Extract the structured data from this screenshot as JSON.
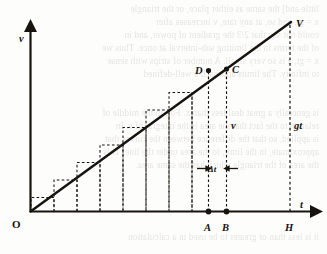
{
  "figure": {
    "kind": "velocity-time-graph",
    "axes": {
      "y_label": "v",
      "x_label": "t",
      "origin_label": "O"
    },
    "point_labels": {
      "apex": "V",
      "d": "D",
      "c": "C",
      "a": "A",
      "b": "B",
      "h": "H"
    },
    "annotations": {
      "height_label": "gt",
      "strip_height_label": "v",
      "strip_width_label": "Δt"
    },
    "colors": {
      "ink": "#17140f",
      "paper": "#fdfdfb",
      "bleed": "#6b6458"
    },
    "bleed_text": [
      "little and] the same as either place, or the triangle",
      "x = gt, and so, at any rate, v increases after",
      "could not say that 2/3 the gradient of power, and in",
      "of the terms in the limiting sub-interval at once. Thus we",
      "x = gt, a is so very small. A number of strips with sense",
      "to infinity. The limits approach a well-defined",
      "is generally a great deal less than x. For, in the middle of",
      "relation to the fact that the area is the integral of v. In",
      "is applied, so that the difference between the curves that",
      "approximate, in the limit, to the area under the line. This",
      "the area of the triangle which has the same area.",
      "it is less than or greater to be used in a calculation"
    ]
  },
  "chart_data": {
    "type": "line",
    "title": "",
    "xlabel": "t",
    "ylabel": "v",
    "xlim": [
      0,
      1
    ],
    "ylim": [
      0,
      1
    ],
    "grid": false,
    "legend": "none",
    "series": [
      {
        "name": "v = gt",
        "x": [
          0,
          1
        ],
        "y": [
          0,
          1
        ],
        "style": "solid-thick"
      }
    ],
    "step_approximation": {
      "description": "Dashed rectangular strips (lower Riemann sum) beneath the line v = gt",
      "n_strips": 11,
      "strip_width_label": "Δt",
      "x_edges": [
        0.0,
        0.0909,
        0.1818,
        0.2727,
        0.3636,
        0.4545,
        0.5455,
        0.6364,
        0.7273,
        0.8182,
        0.9091,
        1.0
      ],
      "heights": [
        0.0909,
        0.1818,
        0.2727,
        0.3636,
        0.4545,
        0.5455,
        0.6364,
        0.7273,
        0.8182,
        0.9091,
        1.0
      ]
    },
    "annotated_points": [
      {
        "label": "O",
        "x": 0.0,
        "y": 0.0,
        "marker": "none"
      },
      {
        "label": "A",
        "x": 0.68,
        "y": 0.0,
        "marker": "filled-dot"
      },
      {
        "label": "B",
        "x": 0.748,
        "y": 0.0,
        "marker": "filled-dot"
      },
      {
        "label": "H",
        "x": 1.0,
        "y": 0.0,
        "marker": "none"
      },
      {
        "label": "D",
        "x": 0.68,
        "y": 0.68,
        "marker": "filled-dot"
      },
      {
        "label": "C",
        "x": 0.748,
        "y": 0.748,
        "marker": "filled-dot"
      },
      {
        "label": "V",
        "x": 1.0,
        "y": 1.0,
        "marker": "none"
      }
    ],
    "annotations": [
      {
        "text": "gt",
        "x": 1.0,
        "y": 0.47,
        "describes": "height of line at t = H"
      },
      {
        "text": "v",
        "x": 0.748,
        "y": 0.47,
        "describes": "ordinate at B"
      },
      {
        "text": "Δt",
        "x": 0.714,
        "y": 0.175,
        "describes": "width AB of one strip"
      }
    ]
  }
}
